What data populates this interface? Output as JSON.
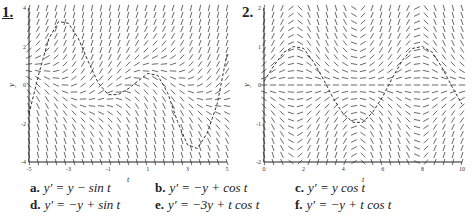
{
  "chart_data": [
    {
      "type": "slope_field",
      "label": "1.",
      "title": "",
      "xlabel": "t",
      "ylabel": "y",
      "xlim": [
        -5,
        5
      ],
      "ylim": [
        -4,
        4
      ],
      "xticks": [
        "-5",
        "-3",
        "-1",
        "1",
        "3",
        "5"
      ],
      "yticks": [
        "-4",
        "-2",
        "0",
        "2",
        "4"
      ],
      "equation_hint": "y' = y - sin t",
      "solution_curve": {
        "t": [
          -5,
          -4.5,
          -4,
          -3.5,
          -3,
          -2.5,
          -2,
          -1.5,
          -1,
          -0.5,
          0,
          0.5,
          1,
          1.5,
          2,
          2.5,
          3,
          3.5,
          4,
          4.5,
          5
        ],
        "y": [
          -1.5,
          0.6,
          2.4,
          3.3,
          3.2,
          2.4,
          1.2,
          0.1,
          -0.5,
          -0.5,
          -0.2,
          0.2,
          0.6,
          0.5,
          -0.4,
          -1.9,
          -3.1,
          -3.3,
          -2.5,
          -1.0,
          1.6
        ]
      }
    },
    {
      "type": "slope_field",
      "label": "2.",
      "title": "",
      "xlabel": "t",
      "ylabel": "y",
      "xlim": [
        0,
        10
      ],
      "ylim": [
        -2,
        2
      ],
      "xticks": [
        "0",
        "2",
        "4",
        "6",
        "8",
        "10"
      ],
      "yticks": [
        "-2",
        "-1",
        "0",
        "1",
        "2"
      ],
      "equation_hint": "y' = y cos t",
      "solution_curve": {
        "t": [
          0,
          0.5,
          1,
          1.5,
          2,
          2.5,
          3,
          3.5,
          4,
          4.5,
          5,
          5.5,
          6,
          6.5,
          7,
          7.5,
          8,
          8.5,
          9,
          9.5,
          10
        ],
        "y": [
          0.1,
          0.5,
          0.85,
          1.0,
          0.95,
          0.6,
          0.15,
          -0.35,
          -0.75,
          -0.97,
          -0.97,
          -0.7,
          -0.3,
          0.2,
          0.65,
          0.95,
          1.0,
          0.85,
          0.45,
          -0.05,
          -0.5
        ]
      }
    }
  ],
  "equations": [
    {
      "letter": "a.",
      "text": "y′ = y − sin t"
    },
    {
      "letter": "b.",
      "text": "y′ = −y + cos t"
    },
    {
      "letter": "c.",
      "text": "y′ = y cos t"
    },
    {
      "letter": "d.",
      "text": "y′ = −y + sin t"
    },
    {
      "letter": "e.",
      "text": "y′ = −3y + t cos t"
    },
    {
      "letter": "f.",
      "text": "y′ = −y + t cos t"
    }
  ]
}
